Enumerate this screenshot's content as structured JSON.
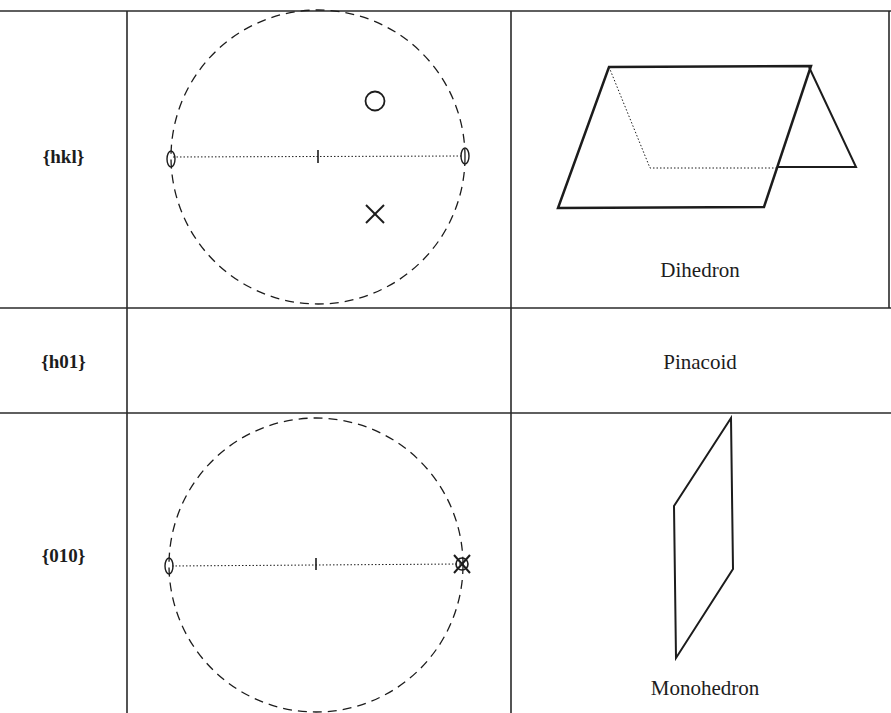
{
  "table": {
    "columns": [
      "Form",
      "Stereogram",
      "Form name"
    ],
    "rows": [
      {
        "form": "{hkl}",
        "name": "Dihedron",
        "stereogram": {
          "primitive": "dashed circle",
          "mirror_trace": "horizontal dotted line with central tick",
          "diad_symbols": "ellipses at both ends of trace",
          "poles": [
            {
              "symbol": "circle",
              "position": "upper hemisphere below, above trace"
            },
            {
              "symbol": "cross",
              "position": "below trace"
            }
          ]
        },
        "figure": "dihedron-drawing"
      },
      {
        "form": "{h01}",
        "name": "Pinacoid",
        "stereogram": null,
        "figure": null
      },
      {
        "form": "{010}",
        "name": "Monohedron",
        "stereogram": {
          "primitive": "dashed circle",
          "mirror_trace": "horizontal dotted line with central tick",
          "diad_symbols": "ellipse at left end of trace",
          "poles": [
            {
              "symbol": "circle-and-cross coincident",
              "position": "right end of trace on primitive"
            }
          ]
        },
        "figure": "monohedron-drawing"
      }
    ]
  },
  "colors": {
    "ink": "#1c1c1c",
    "background": "#ffffff",
    "grid": "#2a2a2a"
  }
}
